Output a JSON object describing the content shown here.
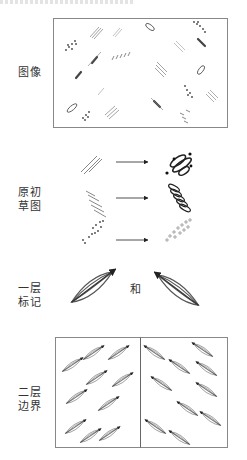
{
  "figure": {
    "rows": [
      {
        "id": "image",
        "label_lines": [
          "图像"
        ]
      },
      {
        "id": "primal-sketch",
        "label_lines": [
          "原初",
          "草图"
        ]
      },
      {
        "id": "first-order-tokens",
        "label_lines": [
          "一层",
          "标记"
        ],
        "connector": "和"
      },
      {
        "id": "second-order-boundary",
        "label_lines": [
          "二层",
          "边界"
        ]
      }
    ]
  },
  "colors": {
    "ink": "#333333",
    "frame": "#888888",
    "faint": "#aaaaaa"
  }
}
